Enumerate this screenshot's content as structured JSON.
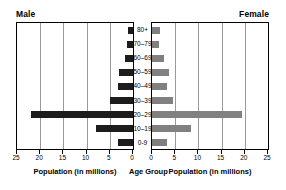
{
  "header": {
    "male_label": "Male",
    "female_label": "Female"
  },
  "captions": {
    "left": "Population (in millions)",
    "middle": "Age Group",
    "right": "Population (in millions)"
  },
  "axis": {
    "left_ticks": [
      "25",
      "20",
      "15",
      "10",
      "5",
      "0"
    ],
    "right_ticks": [
      "0",
      "5",
      "10",
      "15",
      "20",
      "25"
    ]
  },
  "colors": {
    "male_bar": "#1c1c1c",
    "female_bar": "#808080",
    "gridline": "#9a9a9a",
    "frame": "#000000",
    "background": "#ffffff"
  },
  "chart_data": {
    "type": "bar",
    "title": "",
    "subtitle": "",
    "orientation": "horizontal",
    "layout": "population-pyramid",
    "categories": [
      "80+",
      "70–79",
      "60–69",
      "50–59",
      "40–49",
      "30–39",
      "20–29",
      "10–19",
      "0-9"
    ],
    "series": [
      {
        "name": "Male",
        "side": "left",
        "color": "#1c1c1c",
        "values": [
          1.0,
          1.2,
          1.8,
          3.0,
          3.2,
          5.0,
          22.0,
          8.0,
          3.2
        ]
      },
      {
        "name": "Female",
        "side": "right",
        "color": "#808080",
        "values": [
          1.8,
          1.5,
          2.5,
          3.6,
          3.3,
          4.6,
          19.5,
          8.5,
          3.2
        ]
      }
    ],
    "xlabel": "Population (in millions)",
    "ylabel": "Age Group",
    "xlim_left": [
      25,
      0
    ],
    "xlim_right": [
      0,
      25
    ],
    "xticks": [
      0,
      5,
      10,
      15,
      20,
      25
    ],
    "grid": true,
    "legend": "none",
    "legend_position": "top-outside"
  }
}
